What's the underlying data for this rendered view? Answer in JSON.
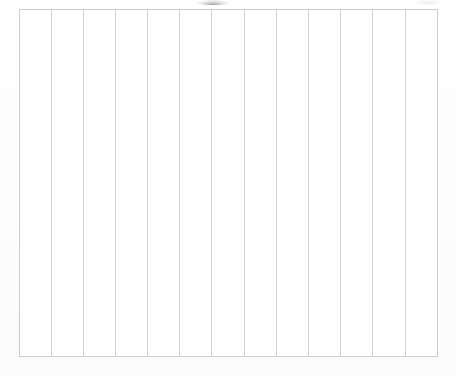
{
  "document": {
    "type": "scanned-form",
    "title": "Blank ruled table",
    "page_background_color": "#fefefe",
    "rule_color": "#d2d2d4",
    "frame_color": "#cdcdd0",
    "is_empty": true
  },
  "table": {
    "caption": "",
    "column_count": 13,
    "row_count": 1,
    "has_header_row": false,
    "has_interior_horizontal_rules": false,
    "bounds": {
      "left": 18,
      "top": 9,
      "width": 421,
      "height": 348
    },
    "column_line_x": [
      19,
      52,
      84,
      116,
      148,
      180,
      212,
      245,
      277,
      309,
      341,
      373,
      406,
      438
    ],
    "columns": [
      {
        "index": 1,
        "header": "",
        "value": ""
      },
      {
        "index": 2,
        "header": "",
        "value": ""
      },
      {
        "index": 3,
        "header": "",
        "value": ""
      },
      {
        "index": 4,
        "header": "",
        "value": ""
      },
      {
        "index": 5,
        "header": "",
        "value": ""
      },
      {
        "index": 6,
        "header": "",
        "value": ""
      },
      {
        "index": 7,
        "header": "",
        "value": ""
      },
      {
        "index": 8,
        "header": "",
        "value": ""
      },
      {
        "index": 9,
        "header": "",
        "value": ""
      },
      {
        "index": 10,
        "header": "",
        "value": ""
      },
      {
        "index": 11,
        "header": "",
        "value": ""
      },
      {
        "index": 12,
        "header": "",
        "value": ""
      },
      {
        "index": 13,
        "header": "",
        "value": ""
      }
    ]
  },
  "artifacts": {
    "top_center_smudge": {
      "label": "scan-smudge",
      "x": 196,
      "y": 0,
      "width": 34,
      "height": 5
    },
    "top_right_smudge": {
      "label": "scan-smudge-right",
      "x": 414,
      "y": 0,
      "width": 30,
      "height": 4
    },
    "interior_speckle": {
      "label": "page-speckle",
      "x": 318,
      "y": 272,
      "width": 10,
      "height": 8
    }
  }
}
